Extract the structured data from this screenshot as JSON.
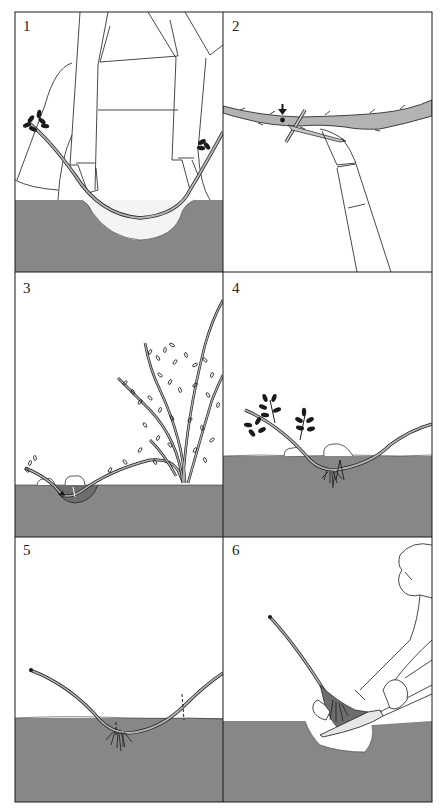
{
  "figure": {
    "colors": {
      "soil": "#878787",
      "stem_fill": "#b3b3b3",
      "outline": "#1a1a1a",
      "background": "#ffffff"
    },
    "panels": [
      {
        "number": "1",
        "caption": "Bend a flexible cane down to the soil and mark where it touches; dig a shallow hole"
      },
      {
        "number": "2",
        "caption": "Make a slanting cut on the underside of the stem behind a bud (arrow) and wedge it open with a matchstick"
      },
      {
        "number": "3",
        "caption": "Peg the wounded section into the hole, tie the tip upright to a cane and cover with soil"
      },
      {
        "number": "4",
        "caption": "The pegged section develops roots while still attached to the parent plant"
      },
      {
        "number": "5",
        "caption": "Once rooted, sever the layer from the parent (dashed lines mark cut points)"
      },
      {
        "number": "6",
        "caption": "Lift the rooted layer with a spade, keeping soil around the roots, and replant"
      }
    ]
  }
}
